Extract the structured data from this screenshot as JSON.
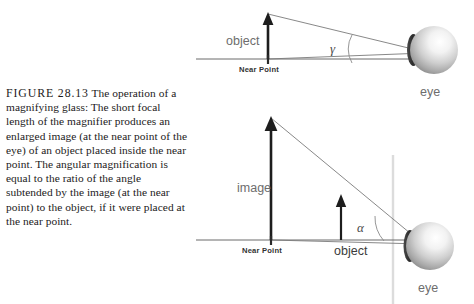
{
  "figure": {
    "label": "FIGURE 28.13",
    "caption_text": " The operation of a magnifying glass: The short focal length of the magnifier produces an enlarged image (at the near point of the eye) of an object placed inside the near point. The angular magnification is equal to the ratio of the angle subtended by the image (at the near point) to the object, if it were placed at the near point."
  },
  "colors": {
    "ink": "#1d1d1d",
    "line": "#6b6b6b",
    "ray": "#7a7a7a",
    "label_gray": "#6d6d6d",
    "label_dark": "#3b3b3b",
    "lens": "#dcdcdc",
    "background": "#ffffff"
  },
  "top_panel": {
    "name": "unaided-eye-diagram",
    "object_label": "object",
    "near_point_label": "Near Point",
    "angle_label": "γ",
    "eye_label": "eye"
  },
  "bottom_panel": {
    "name": "magnifier-diagram",
    "image_label": "image",
    "object_label": "object",
    "near_point_label": "Near Point",
    "angle_label": "α",
    "eye_label": "eye"
  },
  "geometry": {
    "top": {
      "baseline_y": 59,
      "baseline_x1": 196,
      "baseline_x2": 410,
      "near_point_x": 268,
      "object_tip_y": 13,
      "eye_center_x": 434,
      "eye_center_y": 50,
      "eye_radius": 24
    },
    "bottom": {
      "baseline_y": 240,
      "baseline_x1": 196,
      "baseline_x2": 404,
      "near_point_x": 271,
      "image_tip_y": 117,
      "object_x": 341,
      "object_tip_y": 196,
      "lens_x": 393,
      "eye_center_x": 430,
      "eye_center_y": 246,
      "eye_radius": 24
    }
  }
}
